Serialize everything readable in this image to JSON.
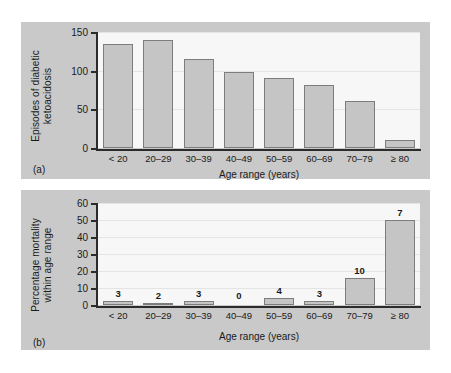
{
  "figure": {
    "panel_a_caption": "(a)",
    "panel_b_caption": "(b)"
  },
  "chart_data": [
    {
      "id": "a",
      "type": "bar",
      "title": "",
      "xlabel": "Age range (years)",
      "ylabel": "Episodes of diabetic ketoacidosis",
      "ylabel_line1": "Episodes of diabetic",
      "ylabel_line2": "ketoacidosis",
      "categories": [
        "< 20",
        "20–29",
        "30–39",
        "40–49",
        "50–59",
        "60–69",
        "70–79",
        "≥ 80"
      ],
      "values": [
        135,
        140,
        115,
        98,
        91,
        82,
        61,
        10
      ],
      "ylim": [
        0,
        150
      ],
      "yticks": [
        0,
        50,
        100,
        150
      ],
      "grid": true,
      "legend": "none",
      "bar_labels": [
        "",
        "",
        "",
        "",
        "",
        "",
        "",
        ""
      ]
    },
    {
      "id": "b",
      "type": "bar",
      "title": "",
      "xlabel": "Age range (years)",
      "ylabel": "Percentage mortality within age range",
      "ylabel_line1": "Percentage mortality",
      "ylabel_line2": "within age range",
      "categories": [
        "< 20",
        "20–29",
        "30–39",
        "40–49",
        "50–59",
        "60–69",
        "70–79",
        "≥ 80"
      ],
      "values": [
        2.2,
        1.4,
        2.6,
        0,
        4.4,
        2.1,
        16,
        50
      ],
      "ylim": [
        0,
        60
      ],
      "yticks": [
        0,
        10,
        20,
        30,
        40,
        50,
        60
      ],
      "grid": true,
      "legend": "none",
      "bar_labels": [
        "3",
        "2",
        "3",
        "0",
        "4",
        "3",
        "10",
        "7"
      ]
    }
  ]
}
